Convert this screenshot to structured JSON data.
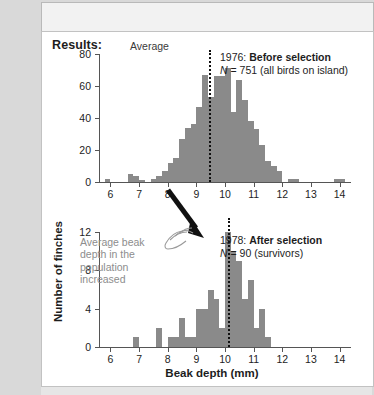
{
  "page": {
    "results_label": "Results:"
  },
  "axes": {
    "y_title": "Number of finches",
    "x_title": "Beak depth (mm)"
  },
  "annotations": {
    "average_label": "Average",
    "grey_note": "Average beak depth in the population increased",
    "hand_icon": "pointing-hand-icon",
    "arrow_icon": "down-arrow-icon"
  },
  "chart_data": [
    {
      "type": "bar",
      "id": "before-selection",
      "title": "1976: Before selection",
      "title_year": "1976:",
      "title_emph": "Before selection",
      "n_label": "N = 751 (all birds on island)",
      "n_italic": "N",
      "n_rest": " = 751 (all birds on island)",
      "xlabel": "Beak depth (mm)",
      "ylabel": "Number of finches",
      "xlim": [
        5.6,
        14.4
      ],
      "ylim": [
        0,
        80
      ],
      "yticks": [
        0,
        20,
        40,
        60,
        80
      ],
      "xticks": [
        6,
        7,
        8,
        9,
        10,
        11,
        12,
        13,
        14
      ],
      "bin_width": 0.2,
      "average": 9.45,
      "grid": false,
      "legend": "none",
      "bar_color": "#8a8a8a",
      "bins": [
        5.8,
        6.0,
        6.2,
        6.4,
        6.6,
        6.8,
        7.0,
        7.2,
        7.4,
        7.6,
        7.8,
        8.0,
        8.2,
        8.4,
        8.6,
        8.8,
        9.0,
        9.2,
        9.4,
        9.6,
        9.8,
        10.0,
        10.2,
        10.4,
        10.6,
        10.8,
        11.0,
        11.2,
        11.4,
        11.6,
        11.8,
        12.0,
        12.2,
        12.4,
        13.8,
        14.0
      ],
      "values": [
        2,
        0,
        0,
        0,
        5,
        4,
        1,
        0,
        2,
        4,
        7,
        12,
        15,
        27,
        34,
        36,
        47,
        67,
        53,
        66,
        66,
        71,
        44,
        64,
        51,
        38,
        33,
        23,
        13,
        10,
        7,
        0,
        2,
        2,
        2,
        2
      ]
    },
    {
      "type": "bar",
      "id": "after-selection",
      "title": "1978: After selection",
      "title_year": "1978:",
      "title_emph": "After selection",
      "n_label": "N = 90 (survivors)",
      "n_italic": "N",
      "n_rest": " = 90 (survivors)",
      "xlabel": "Beak depth (mm)",
      "ylabel": "Number of finches",
      "xlim": [
        5.6,
        14.4
      ],
      "ylim": [
        0,
        12
      ],
      "yticks": [
        0,
        4,
        8,
        12
      ],
      "xticks": [
        6,
        7,
        8,
        9,
        10,
        11,
        12,
        13,
        14
      ],
      "bin_width": 0.2,
      "average": 10.1,
      "grid": false,
      "legend": "none",
      "bar_color": "#8a8a8a",
      "bins": [
        6.8,
        7.0,
        7.6,
        7.8,
        8.0,
        8.2,
        8.4,
        8.6,
        8.8,
        9.0,
        9.2,
        9.4,
        9.6,
        9.8,
        10.0,
        10.2,
        10.4,
        10.6,
        10.8,
        11.0,
        11.2,
        11.4
      ],
      "values": [
        1,
        0,
        2,
        0,
        1,
        1,
        3,
        1,
        1,
        4,
        4,
        6,
        5,
        2,
        12,
        10,
        9,
        5,
        7,
        2,
        4,
        1
      ]
    }
  ]
}
